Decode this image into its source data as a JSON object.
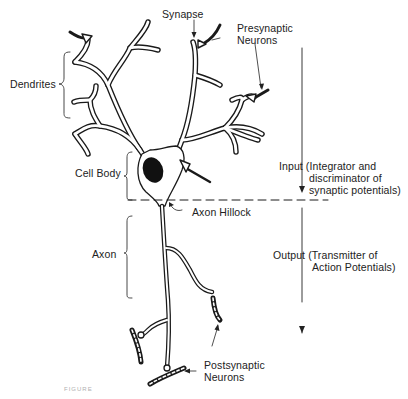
{
  "diagram": {
    "type": "neuron-anatomy",
    "labels": {
      "synapse": "Synapse",
      "presynaptic_line1": "Presynaptic",
      "presynaptic_line2": "Neurons",
      "dendrites": "Dendrites",
      "cell_body": "Cell Body",
      "axon_hillock": "Axon Hillock",
      "axon": "Axon",
      "postsynaptic_line1": "Postsynaptic",
      "postsynaptic_line2": "Neurons",
      "input_line1": "Input (Integrator and",
      "input_line2": "discriminator of",
      "input_line3": "synaptic potentials)",
      "output_line1": "Output (Transmitter of",
      "output_line2": "Action Potentials)"
    },
    "caption": "FIGURE",
    "colors": {
      "ink": "#1a1a1a",
      "background": "#ffffff"
    }
  }
}
